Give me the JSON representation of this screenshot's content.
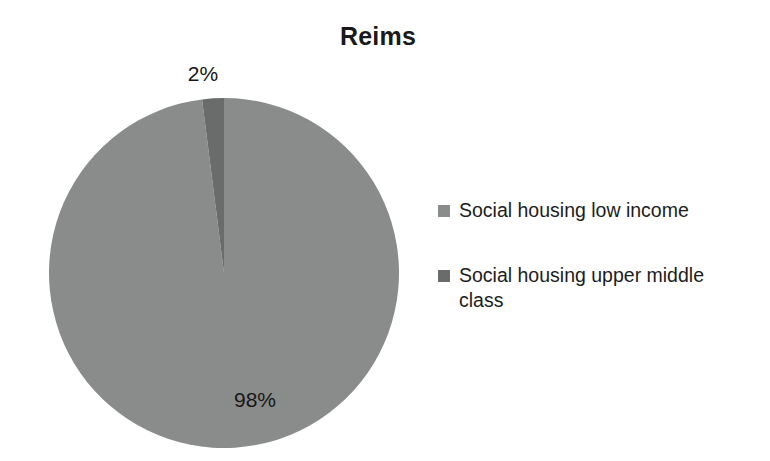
{
  "chart_data": {
    "type": "pie",
    "title": "Reims",
    "categories": [
      "Social housing low income",
      "Social housing upper middle class"
    ],
    "values": [
      98,
      2
    ],
    "value_labels": [
      "98%",
      "2%"
    ],
    "unit": "%",
    "colors": [
      "#8a8c8c",
      "#6a6c6c"
    ],
    "legend_position": "right",
    "grid": false,
    "xlabel": "",
    "ylabel": "",
    "start_angle_deg": 90,
    "direction": "counterclockwise",
    "slices": [
      {
        "name": "Social housing low income",
        "value": 98,
        "label": "98%",
        "color": "#8a8c8c"
      },
      {
        "name": "Social housing upper middle class",
        "value": 2,
        "label": "2%",
        "color": "#6a6c6c"
      }
    ]
  },
  "title": {
    "text": "Reims"
  },
  "labels": {
    "small_slice": "2%",
    "large_slice": "98%"
  },
  "legend": {
    "items": [
      {
        "label": "Social housing low income",
        "color": "#8a8c8c",
        "icon": "legend-swatch-square"
      },
      {
        "label": "Social housing upper middle class",
        "color": "#6a6c6c",
        "icon": "legend-swatch-square"
      }
    ]
  }
}
